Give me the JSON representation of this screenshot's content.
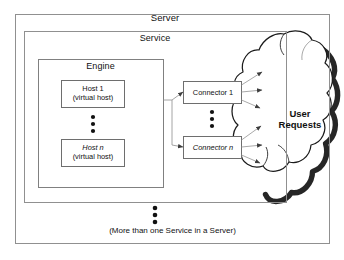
{
  "diagram": {
    "outer_box_label": "Server",
    "service_box_label": "Service",
    "engine_box_label": "Engine",
    "footer_note": "(More than one Service in a Server)",
    "cloud": {
      "label_line1": "User",
      "label_line2": "Requests",
      "name": "user-requests-cloud"
    },
    "hosts": [
      {
        "line1": "Host 1",
        "line2": "(virtual host)"
      },
      {
        "line1": "Host n",
        "line2": "(virtual host)"
      }
    ],
    "connectors": [
      {
        "label": "Connector 1"
      },
      {
        "label": "Connector n"
      }
    ],
    "ellipsis_marker": "⋮",
    "ellipsis_groups": [
      "hosts-vertical-ellipsis",
      "connectors-vertical-ellipsis",
      "services-vertical-ellipsis"
    ],
    "colors": {
      "background": "#ffffff",
      "stroke": "#8c8c8c",
      "box_stroke": "#6e6e6e",
      "text": "#111111",
      "cloud_stroke": "#1a1a1a",
      "cloud_shadow": "#141414",
      "arrow": "#4d4d4d"
    }
  }
}
